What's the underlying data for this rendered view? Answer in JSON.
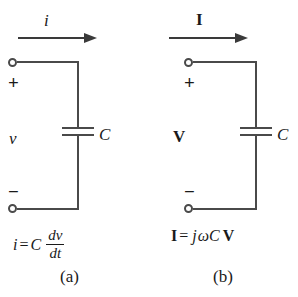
{
  "figure": {
    "background_color": "#ffffff",
    "line_color": "#4a4a4a",
    "text_color": "#1a1a1a"
  },
  "panel_a": {
    "caption": "(a)",
    "current_label": "i",
    "voltage_label": "v",
    "plus_sign": "+",
    "minus_sign": "−",
    "capacitor_label": "C",
    "equation": {
      "lhs": "i",
      "equals": "=",
      "coefficient": "C",
      "numerator": "dv",
      "denominator": "dt",
      "full_text": "i = C dv/dt"
    }
  },
  "panel_b": {
    "caption": "(b)",
    "current_label": "I",
    "voltage_label": "V",
    "plus_sign": "+",
    "minus_sign": "−",
    "capacitor_label": "C",
    "equation": {
      "lhs": "I",
      "equals": "=",
      "j_term": "j",
      "omega_term": "ω",
      "c_term": "C",
      "rhs": "V",
      "full_text": "I = jωC V"
    }
  }
}
